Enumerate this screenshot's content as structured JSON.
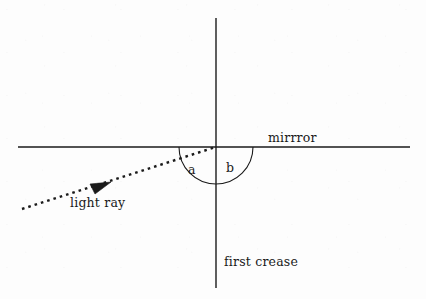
{
  "diagram": {
    "background_color": "#fdfdfd",
    "stroke_color": "#1a1a1a",
    "labels": {
      "mirror": "mirrror",
      "light_ray": "light ray",
      "first_crease": "first crease",
      "angle_a": "a",
      "angle_b": "b"
    },
    "geometry": {
      "origin": {
        "x": 216,
        "y": 147
      },
      "mirror_line": {
        "x1": 18,
        "y1": 147,
        "x2": 410,
        "y2": 147
      },
      "crease_line": {
        "x1": 216,
        "y1": 18,
        "x2": 216,
        "y2": 288
      },
      "ray": {
        "x1": 22,
        "y1": 209,
        "x2": 216,
        "y2": 147
      },
      "arrow_tip": {
        "x": 111,
        "y": 182
      },
      "arc_radius": 37,
      "arc_start": {
        "x": 179,
        "y": 147
      },
      "arc_end": {
        "x": 253,
        "y": 147
      }
    }
  }
}
